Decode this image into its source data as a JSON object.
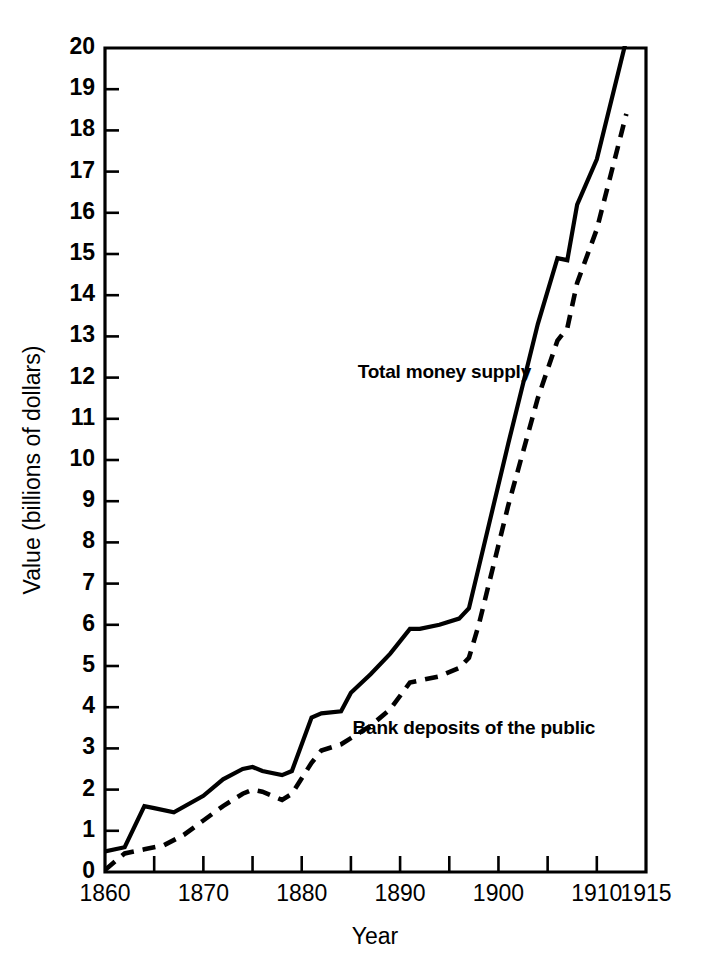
{
  "chart_data": {
    "type": "line",
    "title": "",
    "xlabel": "Year",
    "ylabel": "Value (billions of dollars)",
    "xlim": [
      1860,
      1915
    ],
    "ylim": [
      0,
      20
    ],
    "grid": false,
    "legend_position": "inline-annotation",
    "x_ticks": [
      1860,
      1865,
      1870,
      1875,
      1880,
      1885,
      1890,
      1895,
      1900,
      1905,
      1910,
      1915
    ],
    "x_tick_labels": [
      "1860",
      "",
      "1870",
      "",
      "1880",
      "",
      "1890",
      "",
      "1900",
      "",
      "1910",
      "1915"
    ],
    "x_labeled_ticks": [
      {
        "value": 1860,
        "label": "1860"
      },
      {
        "value": 1870,
        "label": "1870"
      },
      {
        "value": 1880,
        "label": "1880"
      },
      {
        "value": 1890,
        "label": "1890"
      },
      {
        "value": 1900,
        "label": "1900"
      },
      {
        "value": 1910,
        "label": "1910"
      },
      {
        "value": 1915,
        "label": "1915"
      }
    ],
    "y_ticks": [
      0,
      1,
      2,
      3,
      4,
      5,
      6,
      7,
      8,
      9,
      10,
      11,
      12,
      13,
      14,
      15,
      16,
      17,
      18,
      19,
      20
    ],
    "y_tick_labels": [
      "0",
      "1",
      "2",
      "3",
      "4",
      "5",
      "6",
      "7",
      "8",
      "9",
      "10",
      "11",
      "12",
      "13",
      "14",
      "15",
      "16",
      "17",
      "18",
      "19",
      "20"
    ],
    "series": [
      {
        "name": "Total money supply",
        "style": "solid",
        "color": "#000000",
        "label_position": {
          "x": 1894.5,
          "y": 12.0
        },
        "x": [
          1860,
          1862,
          1864,
          1865,
          1867,
          1870,
          1872,
          1874,
          1875,
          1876,
          1878,
          1879,
          1881,
          1882,
          1884,
          1885,
          1887,
          1889,
          1891,
          1892,
          1894,
          1896,
          1897,
          1898,
          1901,
          1904,
          1906,
          1907,
          1908,
          1910,
          1913
        ],
        "y": [
          0.5,
          0.6,
          1.6,
          1.55,
          1.45,
          1.85,
          2.25,
          2.5,
          2.55,
          2.45,
          2.35,
          2.45,
          3.75,
          3.85,
          3.9,
          4.35,
          4.8,
          5.3,
          5.9,
          5.9,
          6.0,
          6.15,
          6.4,
          7.4,
          10.4,
          13.3,
          14.9,
          14.85,
          16.2,
          17.3,
          20.2
        ]
      },
      {
        "name": "Bank deposits of the public",
        "style": "dashed",
        "color": "#000000",
        "label_position": {
          "x": 1897.5,
          "y": 3.35
        },
        "x": [
          1860,
          1862,
          1864,
          1866,
          1868,
          1870,
          1872,
          1874,
          1875,
          1876,
          1878,
          1879,
          1881,
          1882,
          1884,
          1885,
          1887,
          1889,
          1891,
          1892,
          1894,
          1896,
          1897,
          1898,
          1901,
          1904,
          1906,
          1907,
          1908,
          1910,
          1913
        ],
        "y": [
          0.05,
          0.45,
          0.55,
          0.65,
          0.9,
          1.25,
          1.6,
          1.9,
          2.0,
          1.95,
          1.75,
          1.9,
          2.65,
          2.95,
          3.1,
          3.25,
          3.55,
          3.95,
          4.6,
          4.65,
          4.75,
          4.95,
          5.2,
          6.0,
          8.9,
          11.5,
          12.9,
          13.2,
          14.3,
          15.6,
          18.4
        ]
      }
    ]
  },
  "axes": {
    "y_axis_title": "Value (billions of dollars)",
    "x_axis_title": "Year"
  },
  "annotations": {
    "total_money_supply": "Total money supply",
    "bank_deposits": "Bank deposits of the public"
  },
  "colors": {
    "background": "#ffffff",
    "ink": "#000000"
  }
}
